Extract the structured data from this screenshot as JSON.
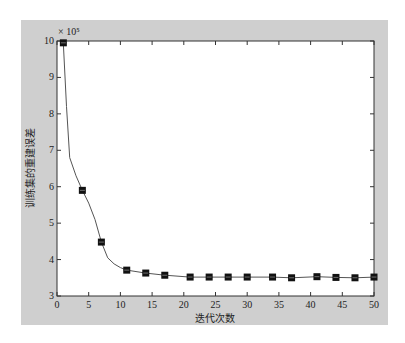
{
  "chart_data": {
    "type": "line",
    "title": "",
    "xlabel": "迭代次数",
    "ylabel": "训练集的重建误差",
    "y_multiplier_label": "× 10⁵",
    "xlim": [
      0,
      50
    ],
    "ylim": [
      3,
      10
    ],
    "x_ticks": [
      0,
      5,
      10,
      15,
      20,
      25,
      30,
      35,
      40,
      45,
      50
    ],
    "y_ticks": [
      3,
      4,
      5,
      6,
      7,
      8,
      9,
      10
    ],
    "grid": false,
    "legend": null,
    "series": [
      {
        "name": "重建误差",
        "marker": "square",
        "line_color": "#555555",
        "marker_color": "#111111",
        "x": [
          1,
          4,
          7,
          11,
          14,
          17,
          21,
          24,
          27,
          30,
          34,
          37,
          41,
          44,
          47,
          50
        ],
        "values": [
          9.95,
          5.9,
          4.48,
          3.71,
          3.63,
          3.57,
          3.52,
          3.52,
          3.52,
          3.52,
          3.52,
          3.5,
          3.53,
          3.51,
          3.5,
          3.52
        ]
      }
    ],
    "curve_shape_hint": {
      "x": [
        1,
        1.5,
        2,
        3,
        4,
        5,
        6,
        7,
        8,
        9,
        10,
        11
      ],
      "values": [
        9.95,
        8.2,
        6.8,
        6.3,
        5.9,
        5.55,
        5.1,
        4.48,
        4.05,
        3.88,
        3.78,
        3.71
      ]
    }
  },
  "colors": {
    "figure_background": "#cfcfcf",
    "plot_background": "#ffffff",
    "axis": "#333333"
  }
}
